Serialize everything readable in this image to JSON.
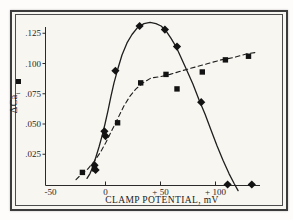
{
  "figure": {
    "kind": "scanned line-scatter figure",
    "frame": "double rectangular border",
    "ink_color": "#1e1e1e",
    "paper_color": "#f7f6f1",
    "legend_marker": "■"
  },
  "chart_data": {
    "type": "scatter",
    "title": "",
    "xlabel": "CLAMP POTENTIAL, mV",
    "ylabel": "ΔCa",
    "ylabel_sub": "i",
    "xlim": [
      -55,
      140
    ],
    "ylim": [
      0,
      0.14
    ],
    "grid": false,
    "legend_position": "left of y-axis (marker only, no text)",
    "x_ticks": [
      {
        "mv": -50,
        "label": "-50"
      },
      {
        "mv": 0,
        "label": "0"
      },
      {
        "mv": 50,
        "label": "+ 50"
      },
      {
        "mv": 100,
        "label": "+ 100"
      }
    ],
    "y_ticks": [
      {
        "value": 0.125,
        "label": ".125"
      },
      {
        "value": 0.1,
        "label": ".100"
      },
      {
        "value": 0.075,
        "label": ".075"
      },
      {
        "value": 0.05,
        "label": ".050"
      },
      {
        "value": 0.025,
        "label": ".025"
      }
    ],
    "series": [
      {
        "name": "diamond-solid-bell-curve",
        "marker": "diamond",
        "line": "solid",
        "points": [
          {
            "x": -10,
            "y": 0.016
          },
          {
            "x": -9,
            "y": 0.012
          },
          {
            "x": -1,
            "y": 0.044
          },
          {
            "x": 0,
            "y": 0.04
          },
          {
            "x": 9,
            "y": 0.094
          },
          {
            "x": 31,
            "y": 0.131
          },
          {
            "x": 54,
            "y": 0.128
          },
          {
            "x": 65,
            "y": 0.114
          },
          {
            "x": 87,
            "y": 0.068
          },
          {
            "x": 111,
            "y": 0.0
          },
          {
            "x": 133,
            "y": 0.0
          }
        ],
        "curve": [
          [
            -16.8,
            0.005
          ],
          [
            -14.1,
            0.009
          ],
          [
            -11.4,
            0.015
          ],
          [
            -8.6,
            0.023
          ],
          [
            -5.9,
            0.031
          ],
          [
            -3.2,
            0.04
          ],
          [
            -0.5,
            0.05
          ],
          [
            2.3,
            0.061
          ],
          [
            5.0,
            0.073
          ],
          [
            7.7,
            0.084
          ],
          [
            11.4,
            0.096
          ],
          [
            15.0,
            0.107
          ],
          [
            19.5,
            0.117
          ],
          [
            24.1,
            0.124
          ],
          [
            29.5,
            0.13
          ],
          [
            35.0,
            0.133
          ],
          [
            40.5,
            0.134
          ],
          [
            45.9,
            0.133
          ],
          [
            50.5,
            0.131
          ],
          [
            55.0,
            0.127
          ],
          [
            59.5,
            0.121
          ],
          [
            64.1,
            0.114
          ],
          [
            68.6,
            0.105
          ],
          [
            74.1,
            0.094
          ],
          [
            79.5,
            0.083
          ],
          [
            85.0,
            0.07
          ],
          [
            90.5,
            0.058
          ],
          [
            95.9,
            0.045
          ],
          [
            101.4,
            0.032
          ],
          [
            106.8,
            0.02
          ],
          [
            112.3,
            0.009
          ],
          [
            116.8,
            0.001
          ],
          [
            120.5,
            -0.005
          ]
        ]
      },
      {
        "name": "square-dashed-saturating-curve",
        "marker": "square",
        "line": "dashed",
        "points": [
          {
            "x": -21,
            "y": 0.01
          },
          {
            "x": -10,
            "y": 0.013
          },
          {
            "x": 11,
            "y": 0.051
          },
          {
            "x": 32,
            "y": 0.084
          },
          {
            "x": 55,
            "y": 0.091
          },
          {
            "x": 65,
            "y": 0.079
          },
          {
            "x": 88,
            "y": 0.093
          },
          {
            "x": 109,
            "y": 0.103
          },
          {
            "x": 130,
            "y": 0.106
          }
        ],
        "curve": [
          [
            -26.8,
            0.004
          ],
          [
            -21.4,
            0.009
          ],
          [
            -15.9,
            0.013
          ],
          [
            -10.5,
            0.019
          ],
          [
            -5.0,
            0.026
          ],
          [
            0.5,
            0.035
          ],
          [
            5.9,
            0.045
          ],
          [
            11.4,
            0.055
          ],
          [
            16.8,
            0.065
          ],
          [
            22.3,
            0.073
          ],
          [
            27.7,
            0.079
          ],
          [
            34.1,
            0.084
          ],
          [
            41.4,
            0.088
          ],
          [
            49.5,
            0.089
          ],
          [
            58.6,
            0.091
          ],
          [
            69.5,
            0.094
          ],
          [
            81.4,
            0.097
          ],
          [
            93.2,
            0.1
          ],
          [
            105.0,
            0.103
          ],
          [
            116.8,
            0.105
          ],
          [
            128.6,
            0.108
          ],
          [
            135.9,
            0.109
          ]
        ]
      }
    ]
  }
}
